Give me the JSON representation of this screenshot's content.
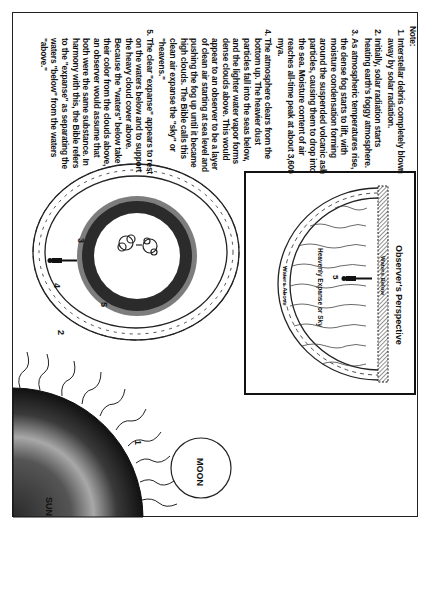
{
  "notes": {
    "header": "Note:",
    "items": [
      "Interstellar debris completely blown away by solar radiation.",
      "Initially, solar radiation starts heating earth's foggy atmosphere.",
      "As atmospheric temperatures rise, the dense fog starts to lift, with moisture condensation forming around the suspended volcanic ash particles, causing them to drop into the sea. Moisture content of air reaches all-time peak at about 3,600 mya.",
      "The atmosphere clears from the bottom up. The heavier dust particles fall into the seas below, and the lighter water vapor forms dense clouds above. This would appear to an observer to be a layer of clean air starting at sea level and pushing the fog up until it became high clouds. The Bible calls this clean air expanse the \"sky\" or \"heavens.\"",
      "The clear \"expanse\" appears to rest on the waters below and to support the heavy cloud cover above. Because the \"waters\" below take their color from the clouds above, an observer would assume that both were the same substance. In harmony with this, the Bible refers to the \"expanse\" as separating the waters \"below\" from the waters \"above.\""
    ]
  },
  "diagram": {
    "sun_label": "SUN",
    "moon_label": "MOON",
    "step_labels": [
      "1",
      "2",
      "3",
      "4",
      "5"
    ],
    "observer_panel": {
      "title": "Observer's Perspective",
      "waters_above": "Waters Above",
      "expanse": "Heavenly Expanse or Sky",
      "waters_below": "Waters Below",
      "step": "5"
    }
  },
  "colors": {
    "ink": "#111111",
    "sun_dark": "#1a1a1a",
    "sun_light": "#9a9a9a",
    "earth_ring_dark": "#2a2a2a",
    "earth_ring_gray": "#7a7a7a"
  }
}
